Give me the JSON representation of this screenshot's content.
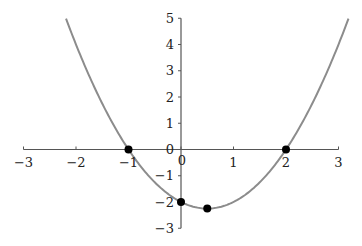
{
  "chart_data": {
    "type": "line",
    "title": "",
    "xlabel": "",
    "ylabel": "",
    "function": "y = x^2 - x - 2",
    "xlim": [
      -3,
      3
    ],
    "ylim": [
      -3,
      5
    ],
    "x_ticks": [
      "-3",
      "-2",
      "-1",
      "0",
      "1",
      "2",
      "3"
    ],
    "y_ticks": [
      "-3",
      "-2",
      "-1",
      "0",
      "1",
      "2",
      "3",
      "4",
      "5"
    ],
    "grid": false,
    "legend": null,
    "series": [
      {
        "name": "parabola",
        "color": "#8c8c8c",
        "x": [
          -2.19,
          -2,
          -1.5,
          -1,
          -0.5,
          0,
          0.5,
          1,
          1.5,
          2,
          2.5,
          3,
          3.19
        ],
        "y": [
          5,
          4,
          1.75,
          0,
          -1.25,
          -2,
          -2.25,
          -2,
          -1.25,
          0,
          1.75,
          4,
          5
        ]
      }
    ],
    "points": [
      {
        "x": -1,
        "y": 0
      },
      {
        "x": 0,
        "y": -2
      },
      {
        "x": 0.5,
        "y": -2.25
      },
      {
        "x": 2,
        "y": 0
      }
    ],
    "colors": {
      "axis": "#555555",
      "curve": "#8c8c8c",
      "point": "#000000"
    }
  },
  "layout": {
    "origin_px": [
      181,
      149.5
    ],
    "x_unit_px": 52.5,
    "y_unit_px": 26.25
  }
}
